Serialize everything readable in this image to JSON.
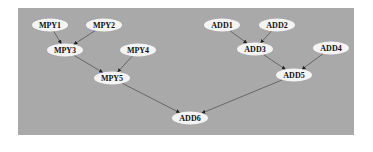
{
  "diagram": {
    "type": "directed-graph",
    "background_color": "#a9a9a9",
    "node_fill": "#f4f4f4",
    "edge_color": "#555555",
    "nodes": [
      {
        "id": "MPY1",
        "label": "MPY1",
        "x": 50,
        "y": 25
      },
      {
        "id": "MPY2",
        "label": "MPY2",
        "x": 104,
        "y": 25
      },
      {
        "id": "MPY3",
        "label": "MPY3",
        "x": 65,
        "y": 50
      },
      {
        "id": "MPY4",
        "label": "MPY4",
        "x": 138,
        "y": 50
      },
      {
        "id": "MPY5",
        "label": "MPY5",
        "x": 112,
        "y": 78
      },
      {
        "id": "ADD1",
        "label": "ADD1",
        "x": 222,
        "y": 25
      },
      {
        "id": "ADD2",
        "label": "ADD2",
        "x": 277,
        "y": 25
      },
      {
        "id": "ADD3",
        "label": "ADD3",
        "x": 255,
        "y": 49
      },
      {
        "id": "ADD4",
        "label": "ADD4",
        "x": 331,
        "y": 48
      },
      {
        "id": "ADD5",
        "label": "ADD5",
        "x": 294,
        "y": 75
      },
      {
        "id": "ADD6",
        "label": "ADD6",
        "x": 190,
        "y": 118
      }
    ],
    "edges": [
      {
        "from": "MPY1",
        "to": "MPY3"
      },
      {
        "from": "MPY2",
        "to": "MPY3"
      },
      {
        "from": "MPY3",
        "to": "MPY5"
      },
      {
        "from": "MPY4",
        "to": "MPY5"
      },
      {
        "from": "ADD1",
        "to": "ADD3"
      },
      {
        "from": "ADD2",
        "to": "ADD3"
      },
      {
        "from": "ADD3",
        "to": "ADD5"
      },
      {
        "from": "ADD4",
        "to": "ADD5"
      },
      {
        "from": "MPY5",
        "to": "ADD6"
      },
      {
        "from": "ADD5",
        "to": "ADD6"
      }
    ]
  }
}
